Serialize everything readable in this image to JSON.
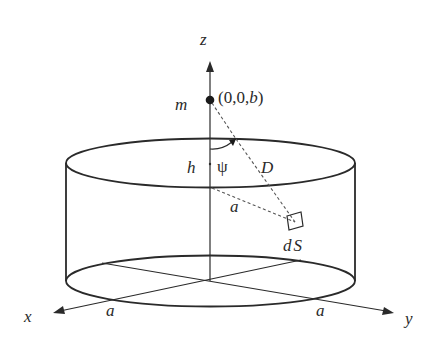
{
  "diagram": {
    "axes": {
      "z_label": "z",
      "x_label": "x",
      "y_label": "y"
    },
    "point": {
      "mass_label": "m",
      "coord_open": "(0,0,",
      "coord_b": "b",
      "coord_close": ")"
    },
    "labels": {
      "height": "h",
      "angle": "ψ",
      "distance": "D",
      "radius_inner": "a",
      "surface_element_d": "d",
      "surface_element_s": "S",
      "radius_x": "a",
      "radius_y": "a"
    },
    "colors": {
      "ink": "#2a2a2a",
      "dash": "#555555",
      "background": "#ffffff"
    }
  }
}
